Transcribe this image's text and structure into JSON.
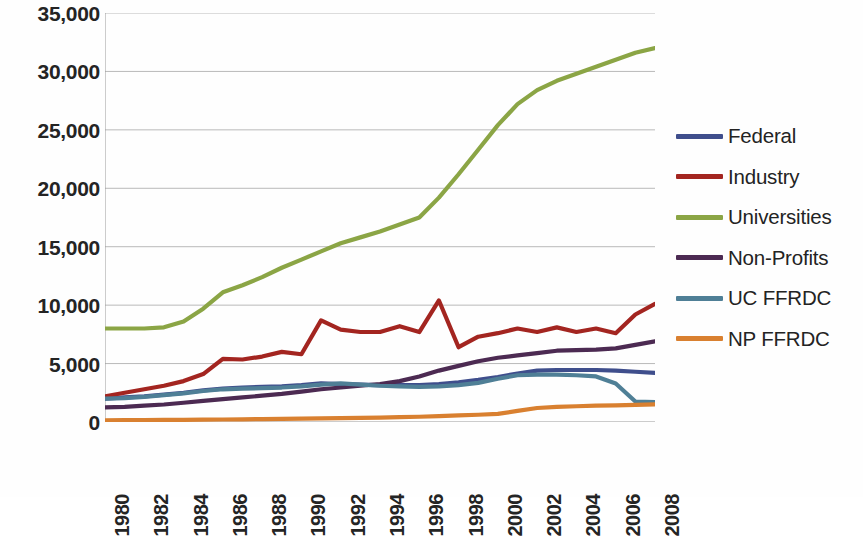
{
  "chart_data": {
    "type": "line",
    "title": "",
    "xlabel": "",
    "ylabel": "",
    "grid": true,
    "legend_position": "right",
    "xlim": [
      1980,
      2008
    ],
    "ylim": [
      0,
      35000
    ],
    "y_ticks": [
      0,
      5000,
      10000,
      15000,
      20000,
      25000,
      30000,
      35000
    ],
    "y_tick_labels": [
      "0",
      "5,000",
      "10,000",
      "15,000",
      "20,000",
      "25,000",
      "30,000",
      "35,000"
    ],
    "x": [
      1980,
      1981,
      1982,
      1983,
      1984,
      1985,
      1986,
      1987,
      1988,
      1989,
      1990,
      1991,
      1992,
      1993,
      1994,
      1995,
      1996,
      1997,
      1998,
      1999,
      2000,
      2001,
      2002,
      2003,
      2004,
      2005,
      2006,
      2007,
      2008
    ],
    "x_tick_labels": [
      "1980",
      "1982",
      "1984",
      "1986",
      "1988",
      "1990",
      "1992",
      "1994",
      "1996",
      "1998",
      "2000",
      "2002",
      "2004",
      "2006",
      "2008"
    ],
    "x_tick_values": [
      1980,
      1982,
      1984,
      1986,
      1988,
      1990,
      1992,
      1994,
      1996,
      1998,
      2000,
      2002,
      2004,
      2006,
      2008
    ],
    "series": [
      {
        "name": "Federal",
        "color": "#3f4e8c",
        "values": [
          2000,
          2100,
          2200,
          2350,
          2500,
          2700,
          2850,
          2950,
          3000,
          3050,
          3150,
          3300,
          3250,
          3200,
          3150,
          3150,
          3150,
          3250,
          3400,
          3600,
          3850,
          4150,
          4400,
          4450,
          4450,
          4450,
          4400,
          4300,
          4200
        ]
      },
      {
        "name": "Industry",
        "color": "#a32520",
        "values": [
          2200,
          2500,
          2800,
          3100,
          3500,
          4100,
          5400,
          5350,
          5600,
          6000,
          5800,
          8700,
          7900,
          7700,
          7700,
          8200,
          7700,
          10400,
          6400,
          7300,
          7600,
          8000,
          7700,
          8100,
          7700,
          8000,
          7600,
          9200,
          10100
        ]
      },
      {
        "name": "Universities",
        "color": "#8ba545",
        "values": [
          8000,
          8000,
          8000,
          8100,
          8600,
          9700,
          11100,
          11700,
          12400,
          13200,
          13900,
          14600,
          15300,
          15800,
          16300,
          16900,
          17500,
          19200,
          21200,
          23300,
          25400,
          27200,
          28400,
          29200,
          29800,
          30400,
          31000,
          31600,
          32000
        ]
      },
      {
        "name": "Non-Profits",
        "color": "#4c2a52",
        "values": [
          1250,
          1300,
          1400,
          1500,
          1650,
          1800,
          1950,
          2100,
          2250,
          2400,
          2600,
          2800,
          2950,
          3100,
          3250,
          3500,
          3900,
          4400,
          4800,
          5200,
          5500,
          5700,
          5900,
          6100,
          6150,
          6200,
          6300,
          6600,
          6900
        ]
      },
      {
        "name": "UC FFRDC",
        "color": "#4f7f96",
        "values": [
          2000,
          2050,
          2150,
          2300,
          2450,
          2650,
          2800,
          2850,
          2900,
          2950,
          3050,
          3200,
          3300,
          3200,
          3100,
          3050,
          3000,
          3050,
          3150,
          3350,
          3700,
          4000,
          4050,
          4050,
          4000,
          3900,
          3300,
          1750,
          1700
        ]
      },
      {
        "name": "NP FFRDC",
        "color": "#d98030",
        "values": [
          150,
          160,
          170,
          180,
          190,
          200,
          215,
          230,
          250,
          270,
          290,
          310,
          330,
          350,
          380,
          410,
          450,
          500,
          560,
          620,
          700,
          950,
          1200,
          1300,
          1350,
          1400,
          1430,
          1470,
          1500
        ]
      }
    ]
  },
  "legend": {
    "items": [
      {
        "label": "Federal",
        "color": "#3f4e8c"
      },
      {
        "label": "Industry",
        "color": "#a32520"
      },
      {
        "label": "Universities",
        "color": "#8ba545"
      },
      {
        "label": "Non-Profits",
        "color": "#4c2a52"
      },
      {
        "label": "UC FFRDC",
        "color": "#4f7f96"
      },
      {
        "label": "NP FFRDC",
        "color": "#d98030"
      }
    ]
  },
  "style": {
    "gridline_color": "#b9b9b9",
    "axis_color": "#9a9a9a",
    "background": "#fefefe",
    "text_color": "#242424"
  }
}
